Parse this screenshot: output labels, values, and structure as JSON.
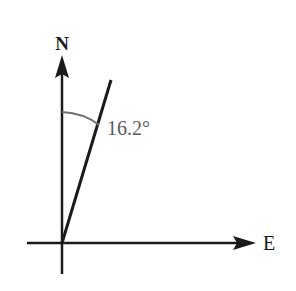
{
  "diagram": {
    "type": "bearing",
    "labels": {
      "north": "N",
      "east": "E",
      "angle": "16.2°"
    },
    "angle_degrees": 16.2,
    "colors": {
      "axis": "#1a1a1a",
      "arc": "#707070",
      "angle_text": "#5a5a5a",
      "background": "#ffffff"
    }
  }
}
